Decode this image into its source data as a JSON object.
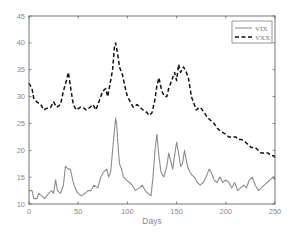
{
  "chart_data": {
    "type": "line",
    "title": "",
    "xlabel": "Days",
    "ylabel": "",
    "xlim": [
      0,
      250
    ],
    "ylim": [
      10,
      45
    ],
    "xticks": [
      0,
      50,
      100,
      150,
      200,
      250
    ],
    "yticks": [
      10,
      15,
      20,
      25,
      30,
      35,
      40,
      45
    ],
    "grid": false,
    "legend_position": "upper right",
    "series": [
      {
        "name": "VIX",
        "style": "solid",
        "color": "#8c8c8c",
        "x": [
          0,
          3,
          5,
          8,
          10,
          13,
          16,
          18,
          20,
          23,
          25,
          27,
          29,
          32,
          35,
          37,
          40,
          42,
          45,
          48,
          50,
          53,
          57,
          60,
          63,
          66,
          70,
          73,
          76,
          79,
          81,
          83,
          85,
          87,
          88,
          89,
          90,
          92,
          94,
          96,
          99,
          102,
          105,
          108,
          112,
          115,
          118,
          121,
          124,
          126,
          128,
          130,
          132,
          134,
          137,
          140,
          142,
          144,
          146,
          148,
          150,
          152,
          154,
          156,
          158,
          160,
          162,
          165,
          168,
          171,
          174,
          177,
          180,
          183,
          185,
          188,
          191,
          194,
          197,
          200,
          203,
          206,
          209,
          212,
          215,
          218,
          221,
          224,
          227,
          230,
          233,
          236,
          239,
          242,
          245,
          248,
          250
        ],
        "values": [
          12.5,
          12.5,
          11,
          11,
          12,
          11.5,
          11,
          11.5,
          12,
          12.5,
          12,
          14.5,
          12.5,
          12,
          13.5,
          17,
          16.5,
          16.5,
          14,
          12.5,
          12,
          11.5,
          12,
          12.5,
          12.5,
          13.5,
          13,
          15,
          16,
          16.5,
          15,
          16,
          20,
          24,
          26,
          25,
          22,
          17.5,
          16.5,
          15,
          14.5,
          14,
          13.5,
          12.5,
          13,
          13.5,
          12.5,
          12,
          11.5,
          15,
          20,
          23,
          19,
          16,
          15,
          17,
          19.5,
          18,
          16.5,
          19,
          21.5,
          19.5,
          17,
          17.5,
          20,
          18,
          16.5,
          15.5,
          15,
          14,
          13.5,
          14,
          15,
          16.5,
          16,
          14.5,
          14,
          15,
          14,
          14.5,
          14,
          13,
          14,
          12.5,
          13,
          13.5,
          13,
          14.5,
          15,
          13.5,
          12.5,
          13,
          13.5,
          14,
          14.5,
          15,
          14.5
        ]
      },
      {
        "name": "VXX",
        "style": "dashed",
        "color": "#111111",
        "x": [
          0,
          3,
          5,
          8,
          12,
          15,
          18,
          22,
          25,
          28,
          32,
          35,
          38,
          40,
          42,
          45,
          48,
          52,
          55,
          58,
          62,
          65,
          68,
          72,
          75,
          78,
          80,
          82,
          85,
          87,
          88,
          90,
          92,
          95,
          98,
          100,
          103,
          106,
          110,
          113,
          116,
          120,
          122,
          125,
          128,
          130,
          132,
          135,
          138,
          140,
          142,
          145,
          148,
          150,
          152,
          154,
          157,
          160,
          162,
          165,
          168,
          170,
          173,
          175,
          178,
          180,
          182,
          185,
          188,
          192,
          195,
          200,
          203,
          206,
          210,
          213,
          216,
          220,
          223,
          226,
          230,
          233,
          236,
          240,
          243,
          246,
          249,
          250
        ],
        "values": [
          32.5,
          31.5,
          29.5,
          29,
          28.5,
          27.5,
          27.8,
          28,
          29,
          28,
          28.5,
          31,
          33,
          34.5,
          32,
          28.5,
          27.5,
          28,
          28,
          27.5,
          28,
          28.5,
          27.5,
          29.5,
          31,
          31.5,
          30,
          32,
          35,
          39.5,
          40,
          38,
          35.5,
          34,
          31.5,
          30,
          29,
          28,
          28.5,
          28,
          27.5,
          27,
          26.5,
          27,
          29.5,
          32,
          33.5,
          31,
          30,
          30,
          31.5,
          33,
          34.5,
          33,
          36,
          34.5,
          35.5,
          34.5,
          33.5,
          30,
          28.5,
          27.5,
          28,
          27.8,
          27,
          26.5,
          26,
          25.5,
          25,
          24,
          23.5,
          23,
          22.5,
          22.5,
          22.5,
          22,
          22,
          21.5,
          21,
          20.5,
          20.5,
          20,
          19.5,
          19.5,
          19.5,
          19,
          19,
          18.5
        ]
      }
    ]
  },
  "axes": {
    "xlabel": "Days",
    "xtick_labels": [
      "0",
      "50",
      "100",
      "150",
      "200",
      "250"
    ],
    "ytick_labels": [
      "10",
      "15",
      "20",
      "25",
      "30",
      "35",
      "40",
      "45"
    ]
  },
  "legend": {
    "items": [
      {
        "label": "VIX",
        "style": "solid",
        "color": "#8c8c8c"
      },
      {
        "label": "VXX",
        "style": "dashed",
        "color": "#111111"
      }
    ]
  },
  "colors": {
    "axis": "#555555",
    "tick_text": "#8a8a8a",
    "background": "#ffffff"
  }
}
